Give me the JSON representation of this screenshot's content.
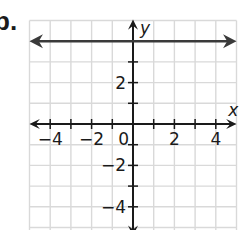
{
  "problem_label": "b.",
  "chart_data": {
    "type": "line",
    "title": "",
    "xlabel": "x",
    "ylabel": "y",
    "xlim": [
      -5,
      5
    ],
    "ylim": [
      -5,
      5
    ],
    "grid": true,
    "x_tick_labels": [
      "−4",
      "−2",
      "0",
      "2",
      "4"
    ],
    "y_tick_labels": [
      "2",
      "−2",
      "−4"
    ],
    "series": [
      {
        "name": "y = 4",
        "equation": "y = 4",
        "x": [
          -5,
          5
        ],
        "y": [
          4,
          4
        ],
        "style": "line with arrows both ends"
      }
    ],
    "colors": {
      "line": "#3a3a3a",
      "axes": "#1a1a1a",
      "grid": "#d9d9d9"
    }
  },
  "axes": {
    "x_name": "x",
    "y_name": "y"
  },
  "ticks": {
    "x": [
      {
        "label": "−4",
        "value": -4
      },
      {
        "label": "−2",
        "value": -2
      },
      {
        "label": "0",
        "value": 0
      },
      {
        "label": "2",
        "value": 2
      },
      {
        "label": "4",
        "value": 4
      }
    ],
    "y": [
      {
        "label": "2",
        "value": 2
      },
      {
        "label": "−2",
        "value": -2
      },
      {
        "label": "−4",
        "value": -4
      }
    ]
  }
}
